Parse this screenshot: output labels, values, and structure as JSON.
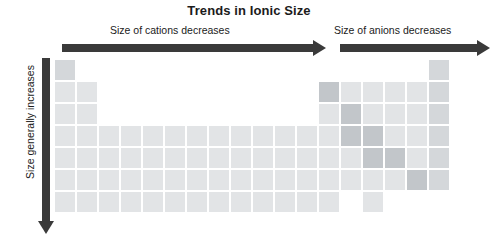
{
  "title": "Trends in Ionic Size",
  "annotations": {
    "cations_label": "Size of cations decreases",
    "anions_label": "Size of anions decreases",
    "vertical_label": "Size generally increases"
  },
  "colors": {
    "arrow": "#3a3a3a",
    "text": "#1b1b1b",
    "background": "#ffffff",
    "cell_light": "#e2e4e6",
    "cell_mid": "#d4d7da",
    "cell_dark": "#c2c6ca"
  },
  "chart_data": {
    "type": "heatmap",
    "title": "Trends in Ionic Size",
    "xlabel": "",
    "ylabel": "",
    "grid": false,
    "legend_position": "none",
    "columns": 18,
    "rows": 7,
    "cell_size_px": 20,
    "cell_pitch_px": 22,
    "cells": [
      {
        "row": 1,
        "col": 1,
        "shade": "mid"
      },
      {
        "row": 1,
        "col": 18,
        "shade": "mid"
      },
      {
        "row": 2,
        "col": 1,
        "shade": "light"
      },
      {
        "row": 2,
        "col": 2,
        "shade": "light"
      },
      {
        "row": 2,
        "col": 13,
        "shade": "dark"
      },
      {
        "row": 2,
        "col": 14,
        "shade": "light"
      },
      {
        "row": 2,
        "col": 15,
        "shade": "light"
      },
      {
        "row": 2,
        "col": 16,
        "shade": "light"
      },
      {
        "row": 2,
        "col": 17,
        "shade": "light"
      },
      {
        "row": 2,
        "col": 18,
        "shade": "mid"
      },
      {
        "row": 3,
        "col": 1,
        "shade": "light"
      },
      {
        "row": 3,
        "col": 2,
        "shade": "light"
      },
      {
        "row": 3,
        "col": 13,
        "shade": "light"
      },
      {
        "row": 3,
        "col": 14,
        "shade": "dark"
      },
      {
        "row": 3,
        "col": 15,
        "shade": "light"
      },
      {
        "row": 3,
        "col": 16,
        "shade": "light"
      },
      {
        "row": 3,
        "col": 17,
        "shade": "light"
      },
      {
        "row": 3,
        "col": 18,
        "shade": "mid"
      },
      {
        "row": 4,
        "col": 1,
        "shade": "light"
      },
      {
        "row": 4,
        "col": 2,
        "shade": "light"
      },
      {
        "row": 4,
        "col": 3,
        "shade": "light"
      },
      {
        "row": 4,
        "col": 4,
        "shade": "light"
      },
      {
        "row": 4,
        "col": 5,
        "shade": "light"
      },
      {
        "row": 4,
        "col": 6,
        "shade": "light"
      },
      {
        "row": 4,
        "col": 7,
        "shade": "light"
      },
      {
        "row": 4,
        "col": 8,
        "shade": "light"
      },
      {
        "row": 4,
        "col": 9,
        "shade": "light"
      },
      {
        "row": 4,
        "col": 10,
        "shade": "light"
      },
      {
        "row": 4,
        "col": 11,
        "shade": "light"
      },
      {
        "row": 4,
        "col": 12,
        "shade": "light"
      },
      {
        "row": 4,
        "col": 13,
        "shade": "light"
      },
      {
        "row": 4,
        "col": 14,
        "shade": "dark"
      },
      {
        "row": 4,
        "col": 15,
        "shade": "dark"
      },
      {
        "row": 4,
        "col": 16,
        "shade": "light"
      },
      {
        "row": 4,
        "col": 17,
        "shade": "light"
      },
      {
        "row": 4,
        "col": 18,
        "shade": "mid"
      },
      {
        "row": 5,
        "col": 1,
        "shade": "light"
      },
      {
        "row": 5,
        "col": 2,
        "shade": "light"
      },
      {
        "row": 5,
        "col": 3,
        "shade": "light"
      },
      {
        "row": 5,
        "col": 4,
        "shade": "light"
      },
      {
        "row": 5,
        "col": 5,
        "shade": "light"
      },
      {
        "row": 5,
        "col": 6,
        "shade": "light"
      },
      {
        "row": 5,
        "col": 7,
        "shade": "light"
      },
      {
        "row": 5,
        "col": 8,
        "shade": "light"
      },
      {
        "row": 5,
        "col": 9,
        "shade": "light"
      },
      {
        "row": 5,
        "col": 10,
        "shade": "light"
      },
      {
        "row": 5,
        "col": 11,
        "shade": "light"
      },
      {
        "row": 5,
        "col": 12,
        "shade": "light"
      },
      {
        "row": 5,
        "col": 13,
        "shade": "light"
      },
      {
        "row": 5,
        "col": 14,
        "shade": "light"
      },
      {
        "row": 5,
        "col": 15,
        "shade": "dark"
      },
      {
        "row": 5,
        "col": 16,
        "shade": "dark"
      },
      {
        "row": 5,
        "col": 17,
        "shade": "light"
      },
      {
        "row": 5,
        "col": 18,
        "shade": "mid"
      },
      {
        "row": 6,
        "col": 1,
        "shade": "light"
      },
      {
        "row": 6,
        "col": 2,
        "shade": "light"
      },
      {
        "row": 6,
        "col": 3,
        "shade": "light"
      },
      {
        "row": 6,
        "col": 4,
        "shade": "light"
      },
      {
        "row": 6,
        "col": 5,
        "shade": "light"
      },
      {
        "row": 6,
        "col": 6,
        "shade": "light"
      },
      {
        "row": 6,
        "col": 7,
        "shade": "light"
      },
      {
        "row": 6,
        "col": 8,
        "shade": "light"
      },
      {
        "row": 6,
        "col": 9,
        "shade": "light"
      },
      {
        "row": 6,
        "col": 10,
        "shade": "light"
      },
      {
        "row": 6,
        "col": 11,
        "shade": "light"
      },
      {
        "row": 6,
        "col": 12,
        "shade": "light"
      },
      {
        "row": 6,
        "col": 13,
        "shade": "light"
      },
      {
        "row": 6,
        "col": 14,
        "shade": "light"
      },
      {
        "row": 6,
        "col": 15,
        "shade": "light"
      },
      {
        "row": 6,
        "col": 16,
        "shade": "light"
      },
      {
        "row": 6,
        "col": 17,
        "shade": "dark"
      },
      {
        "row": 6,
        "col": 18,
        "shade": "mid"
      },
      {
        "row": 7,
        "col": 1,
        "shade": "light"
      },
      {
        "row": 7,
        "col": 2,
        "shade": "light"
      },
      {
        "row": 7,
        "col": 3,
        "shade": "light"
      },
      {
        "row": 7,
        "col": 4,
        "shade": "light"
      },
      {
        "row": 7,
        "col": 5,
        "shade": "light"
      },
      {
        "row": 7,
        "col": 6,
        "shade": "light"
      },
      {
        "row": 7,
        "col": 7,
        "shade": "light"
      },
      {
        "row": 7,
        "col": 8,
        "shade": "light"
      },
      {
        "row": 7,
        "col": 9,
        "shade": "light"
      },
      {
        "row": 7,
        "col": 10,
        "shade": "light"
      },
      {
        "row": 7,
        "col": 11,
        "shade": "light"
      },
      {
        "row": 7,
        "col": 12,
        "shade": "light"
      },
      {
        "row": 7,
        "col": 13,
        "shade": "light"
      },
      {
        "row": 7,
        "col": 15,
        "shade": "light"
      }
    ]
  }
}
